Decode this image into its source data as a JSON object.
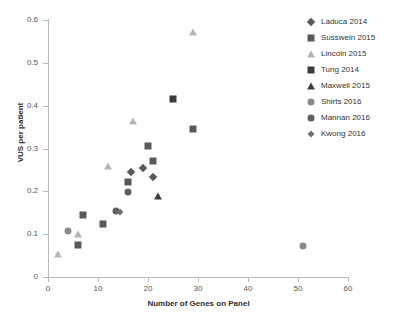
{
  "chart_data": {
    "type": "scatter",
    "title": "",
    "xlabel": "Number of Genes on Panel",
    "ylabel": "VUS per patient",
    "xlim": [
      0,
      60
    ],
    "ylim": [
      0,
      0.6
    ],
    "xticks": [
      "0",
      "10",
      "20",
      "30",
      "40",
      "50",
      "60"
    ],
    "yticks": [
      "0",
      "0.1",
      "0.2",
      "0.3",
      "0.4",
      "0.5",
      "0.6"
    ],
    "xtick_values": [
      0,
      10,
      20,
      30,
      40,
      50,
      60
    ],
    "ytick_values": [
      0,
      0.1,
      0.2,
      0.3,
      0.4,
      0.5,
      0.6
    ],
    "grid": false,
    "legend_position": "right",
    "series": [
      {
        "name": "Laduca 2014",
        "marker": "diamond",
        "color": "#595959",
        "points": [
          {
            "x": 19,
            "y": 0.255
          },
          {
            "x": 21,
            "y": 0.234
          },
          {
            "x": 16.5,
            "y": 0.245
          }
        ]
      },
      {
        "name": "Susswein 2015",
        "marker": "square",
        "color": "#595959",
        "points": [
          {
            "x": 20,
            "y": 0.305
          },
          {
            "x": 21,
            "y": 0.271
          },
          {
            "x": 16,
            "y": 0.221
          },
          {
            "x": 11,
            "y": 0.123
          },
          {
            "x": 7,
            "y": 0.144
          },
          {
            "x": 6,
            "y": 0.074
          },
          {
            "x": 29,
            "y": 0.346
          }
        ]
      },
      {
        "name": "Lincoln 2015",
        "marker": "triangle",
        "color": "#b5b5b5",
        "points": [
          {
            "x": 29,
            "y": 0.573
          },
          {
            "x": 17,
            "y": 0.364
          },
          {
            "x": 12,
            "y": 0.259
          },
          {
            "x": 6,
            "y": 0.1
          },
          {
            "x": 2,
            "y": 0.053
          }
        ]
      },
      {
        "name": "Tung 2014",
        "marker": "square-dark",
        "color": "#3d3d3d",
        "points": [
          {
            "x": 25,
            "y": 0.415
          }
        ]
      },
      {
        "name": "Maxwell 2015",
        "marker": "triangle-dark",
        "color": "#3d3d3d",
        "points": [
          {
            "x": 22,
            "y": 0.189
          }
        ]
      },
      {
        "name": "Shirts 2016",
        "marker": "circle",
        "color": "#8a8a8a",
        "points": [
          {
            "x": 51,
            "y": 0.072
          },
          {
            "x": 4,
            "y": 0.108
          }
        ]
      },
      {
        "name": "Mannan 2016",
        "marker": "circle-dark",
        "color": "#5e5e5e",
        "points": [
          {
            "x": 16,
            "y": 0.199
          },
          {
            "x": 13.5,
            "y": 0.155
          }
        ]
      },
      {
        "name": "Kwong 2016",
        "marker": "diamond-small",
        "color": "#707070",
        "points": [
          {
            "x": 14.3,
            "y": 0.152
          }
        ]
      }
    ]
  },
  "legend": {
    "items": [
      {
        "label": "Laduca 2014",
        "marker": "diamond",
        "color": "#595959"
      },
      {
        "label": "Susswein 2015",
        "marker": "square",
        "color": "#595959"
      },
      {
        "label": "Lincoln 2015",
        "marker": "triangle",
        "color": "#b5b5b5"
      },
      {
        "label": "Tung 2014",
        "marker": "square-dark",
        "color": "#3d3d3d"
      },
      {
        "label": "Maxwell 2015",
        "marker": "triangle-dark",
        "color": "#3d3d3d"
      },
      {
        "label": "Shirts 2016",
        "marker": "circle",
        "color": "#8a8a8a"
      },
      {
        "label": "Mannan 2016",
        "marker": "circle-dark",
        "color": "#5e5e5e"
      },
      {
        "label": "Kwong 2016",
        "marker": "diamond-small",
        "color": "#707070"
      }
    ]
  },
  "colors": {
    "axis": "#b9b9b9",
    "tick_text": "#555555",
    "title_text": "#2e2e2e",
    "background": "#ffffff"
  }
}
